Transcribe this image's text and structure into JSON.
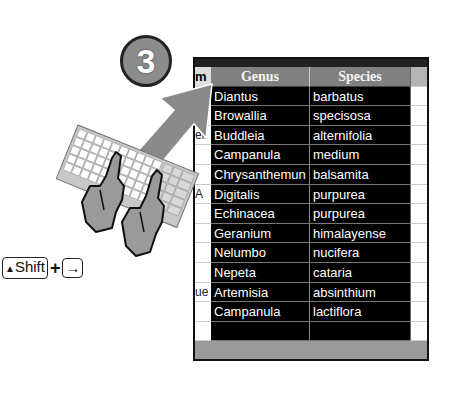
{
  "step": {
    "number": "3"
  },
  "shortcut": {
    "key1_icon": "shift-arrow-icon",
    "key1_label": "Shift",
    "plus": "+",
    "key2_label": "→"
  },
  "table": {
    "left_column_fragments": [
      "m",
      "e",
      "",
      "ell",
      "",
      "",
      "A",
      "",
      "",
      "",
      "",
      "ue",
      ""
    ],
    "headers": [
      "Genus",
      "Species"
    ],
    "rows": [
      {
        "genus": "Diantus",
        "species": "barbatus"
      },
      {
        "genus": "Browallia",
        "species": "specisosa"
      },
      {
        "genus": "Buddleia",
        "species": "alternifolia"
      },
      {
        "genus": "Campanula",
        "species": "medium"
      },
      {
        "genus": "Chrysanthemun",
        "species": "balsamita"
      },
      {
        "genus": "Digitalis",
        "species": "purpurea"
      },
      {
        "genus": "Echinacea",
        "species": "purpurea"
      },
      {
        "genus": "Geranium",
        "species": "himalayense"
      },
      {
        "genus": "Nelumbo",
        "species": "nucifera"
      },
      {
        "genus": "Nepeta",
        "species": "cataria"
      },
      {
        "genus": "Artemisia",
        "species": "absinthium"
      },
      {
        "genus": "Campanula",
        "species": "lactiflora"
      },
      {
        "genus": "",
        "species": ""
      }
    ]
  },
  "colors": {
    "selection": "#000000",
    "header": "#808080",
    "badge": "#8c8c8c",
    "arrow": "#8a8a8a"
  }
}
